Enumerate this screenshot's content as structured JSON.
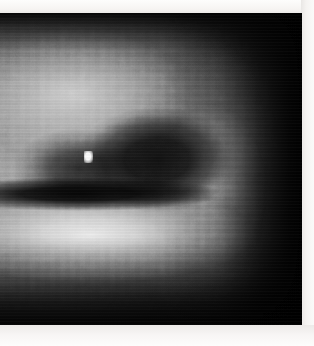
{
  "image": {
    "kind": "grayscale-scan",
    "title": "Grayscale Scan Image",
    "description": "Low-resolution pixelated grayscale scan showing a bright crescent/annular structure with a dark elliptical core, fading to black toward the right edge.",
    "colorspace": "grayscale",
    "frame": {
      "x": 0,
      "y": 13,
      "width": 302,
      "height": 312,
      "background_hex": "#000000"
    },
    "canvas": {
      "width": 314,
      "height": 346,
      "page_hex": "#f4f2f0"
    },
    "margins": {
      "top_hex": "#fdfdfc",
      "right_hex": "#fbfaf9",
      "bottom_hex": "#fdfdfc",
      "top_px": 13,
      "right_px": 13,
      "bottom_px": 21,
      "left_px": 0
    },
    "features": [
      {
        "name": "bright-upper-lobe",
        "label": "Bright upper-left lobe",
        "center_pct": [
          24,
          26
        ],
        "peak_hex": "#d7d7d7"
      },
      {
        "name": "dark-core",
        "label": "Dark elliptical core",
        "center_pct": [
          52,
          47
        ],
        "peak_hex": "#0a0a0a"
      },
      {
        "name": "dark-band",
        "label": "Dark horizontal separation band",
        "center_pct": [
          26,
          58
        ],
        "peak_hex": "#000000"
      },
      {
        "name": "bright-lower-crescent",
        "label": "Bright lower crescent arc",
        "center_pct": [
          30,
          71
        ],
        "peak_hex": "#f0f0f0"
      },
      {
        "name": "right-arc",
        "label": "Right-hand crescent tip",
        "center_pct": [
          70,
          57
        ],
        "peak_hex": "#e1e1e1"
      },
      {
        "name": "bright-speck",
        "label": "Saturated white speck",
        "center_px": [
          88,
          157
        ],
        "peak_hex": "#ffffff"
      },
      {
        "name": "black-falloff",
        "label": "Black falloff region (right)",
        "center_pct": [
          92,
          30
        ],
        "peak_hex": "#000000"
      }
    ]
  }
}
